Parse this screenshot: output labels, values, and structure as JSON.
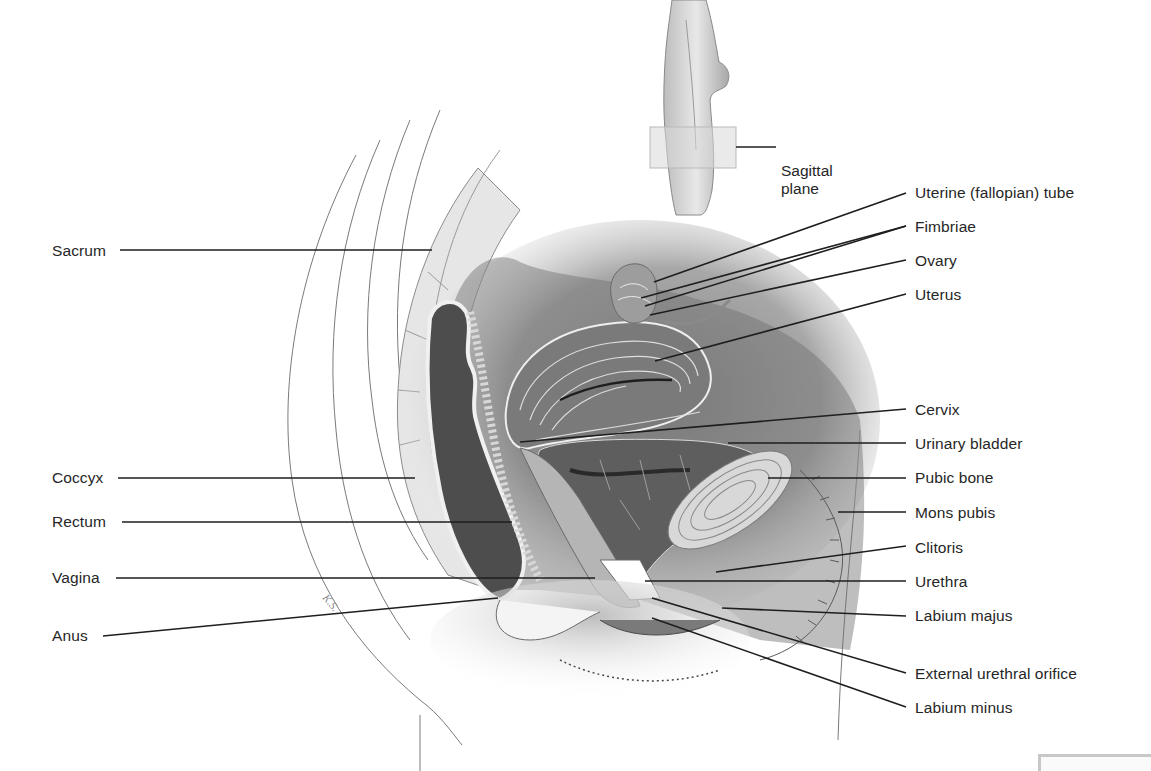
{
  "figure": {
    "inset": {
      "label_line1": "Sagittal",
      "label_line2": "plane"
    },
    "signature": "K.S."
  },
  "labels_left": [
    {
      "id": "sacrum",
      "text": "Sacrum",
      "x": 52,
      "y": 242,
      "line": [
        120,
        250,
        432,
        250
      ]
    },
    {
      "id": "coccyx",
      "text": "Coccyx",
      "x": 52,
      "y": 469,
      "line": [
        118,
        478,
        415,
        478
      ]
    },
    {
      "id": "rectum",
      "text": "Rectum",
      "x": 52,
      "y": 513,
      "line": [
        122,
        522,
        512,
        522
      ]
    },
    {
      "id": "vagina",
      "text": "Vagina",
      "x": 52,
      "y": 569,
      "line": [
        116,
        578,
        595,
        578
      ]
    },
    {
      "id": "anus",
      "text": "Anus",
      "x": 52,
      "y": 627,
      "line": [
        103,
        636,
        498,
        598
      ]
    }
  ],
  "labels_right": [
    {
      "id": "uterine-tube",
      "text": "Uterine (fallopian) tube",
      "x": 915,
      "y": 184,
      "line": [
        654,
        282,
        906,
        193
      ]
    },
    {
      "id": "fimbriae",
      "text": "Fimbriae",
      "x": 915,
      "y": 218,
      "lines": [
        [
          641,
          298,
          906,
          226
        ],
        [
          645,
          306,
          906,
          226
        ]
      ]
    },
    {
      "id": "ovary",
      "text": "Ovary",
      "x": 915,
      "y": 252,
      "line": [
        650,
        315,
        906,
        260
      ]
    },
    {
      "id": "uterus",
      "text": "Uterus",
      "x": 915,
      "y": 286,
      "line": [
        655,
        361,
        906,
        294
      ]
    },
    {
      "id": "cervix",
      "text": "Cervix",
      "x": 915,
      "y": 401,
      "line": [
        520,
        442,
        906,
        409
      ]
    },
    {
      "id": "urinary-bladder",
      "text": "Urinary bladder",
      "x": 915,
      "y": 435,
      "line": [
        728,
        443,
        906,
        443
      ]
    },
    {
      "id": "pubic-bone",
      "text": "Pubic bone",
      "x": 915,
      "y": 469,
      "line": [
        768,
        478,
        906,
        478
      ]
    },
    {
      "id": "mons-pubis",
      "text": "Mons pubis",
      "x": 915,
      "y": 504,
      "line": [
        838,
        512,
        906,
        512
      ]
    },
    {
      "id": "clitoris",
      "text": "Clitoris",
      "x": 915,
      "y": 539,
      "line": [
        716,
        572,
        906,
        546
      ]
    },
    {
      "id": "urethra",
      "text": "Urethra",
      "x": 915,
      "y": 573,
      "line": [
        645,
        581,
        906,
        581
      ]
    },
    {
      "id": "labium-majus",
      "text": "Labium majus",
      "x": 915,
      "y": 607,
      "line": [
        722,
        608,
        906,
        616
      ]
    },
    {
      "id": "external-urethral-orifice",
      "text": "External urethral orifice",
      "x": 915,
      "y": 665,
      "line": [
        652,
        598,
        906,
        673
      ]
    },
    {
      "id": "labium-minus",
      "text": "Labium minus",
      "x": 915,
      "y": 699,
      "line": [
        652,
        618,
        906,
        707
      ]
    }
  ],
  "colors": {
    "background": "#ffffff",
    "text": "#262626",
    "leader": "#1e1e1e",
    "tissue_light": "#e2e2e2",
    "tissue_mid": "#9a9a9a",
    "tissue_dark": "#4a4a4a",
    "outline": "#6a6a6a"
  }
}
